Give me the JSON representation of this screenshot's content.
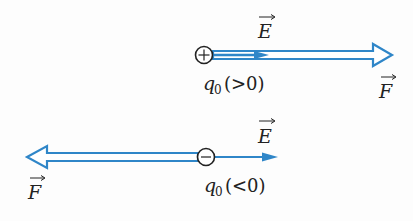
{
  "colors": {
    "arrow_blue": "#2f86c8",
    "ink": "#222222",
    "background": "#fdfdfd"
  },
  "positive_case": {
    "charge_symbol": "+",
    "charge_label": "q",
    "charge_subscript": "0",
    "charge_condition": "(>0)",
    "field_label": "E",
    "force_label": "F",
    "force_direction": "right",
    "field_direction": "right"
  },
  "negative_case": {
    "charge_symbol": "−",
    "charge_label": "q",
    "charge_subscript": "0",
    "charge_condition": "(<0)",
    "field_label": "E",
    "force_label": "F",
    "force_direction": "left",
    "field_direction": "right"
  }
}
